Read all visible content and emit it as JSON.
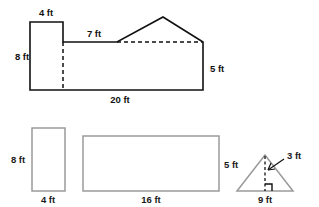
{
  "figure": {
    "canvas": {
      "width": 319,
      "height": 207,
      "background": "#ffffff"
    },
    "colors": {
      "dark_stroke": "#111111",
      "gray_stroke": "#9a9a9a",
      "label_text": "#111111",
      "background": "#ffffff"
    },
    "composite_shape": {
      "name": "house-shaped-composite-figure",
      "labels": {
        "top_small_rect_width": "4 ft",
        "left_height": "8 ft",
        "upper_horizontal": "7 ft",
        "right_height": "5 ft",
        "base_width": "20 ft"
      }
    },
    "decomposed_parts": [
      {
        "name": "tall-rectangle",
        "type": "rectangle",
        "height_label": "8 ft",
        "width_label": "4 ft"
      },
      {
        "name": "wide-rectangle",
        "type": "rectangle",
        "height_label": "5 ft",
        "width_label": "16 ft"
      },
      {
        "name": "triangle",
        "type": "triangle",
        "height_label": "3 ft",
        "base_label": "9 ft"
      }
    ]
  }
}
